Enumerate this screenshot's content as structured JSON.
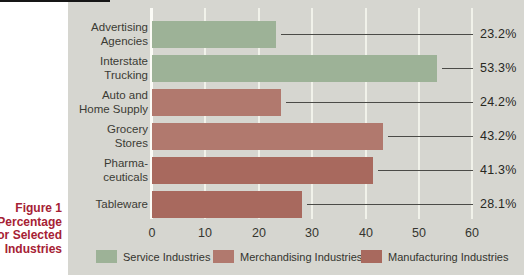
{
  "figure_label": {
    "lines": [
      "Figure 1",
      "Percentage",
      "for Selected",
      "Industries"
    ]
  },
  "colors": {
    "page_bg": "#ffffff",
    "panel_bg": "#d6d6d0",
    "gridline": "#f1f2ea",
    "axis_line": "#fbfbf6",
    "callout_line": "#4b4b47",
    "figure_label_text": "#a62134",
    "page_edge_line": "#161616",
    "series": {
      "service": "#9db297",
      "merchandising": "#b1796e",
      "manufacturing": "#a8695e"
    }
  },
  "chart_data": {
    "type": "bar",
    "orientation": "horizontal",
    "title": "",
    "xlabel": "",
    "ylabel": "",
    "xlim": [
      0,
      60
    ],
    "x_ticks": [
      0,
      10,
      20,
      30,
      40,
      50,
      60
    ],
    "grid": true,
    "legend_position": "bottom",
    "categories": [
      "Advertising Agencies",
      "Interstate Trucking",
      "Auto and Home Supply",
      "Grocery Stores",
      "Pharmaceuticals",
      "Tableware"
    ],
    "category_label_lines": [
      [
        "Advertising",
        "Agencies"
      ],
      [
        "Interstate",
        "Trucking"
      ],
      [
        "Auto and",
        "Home Supply"
      ],
      [
        "Grocery",
        "Stores"
      ],
      [
        "Pharma-",
        "ceuticals"
      ],
      [
        "Tableware"
      ]
    ],
    "values": [
      23.2,
      53.3,
      24.2,
      43.2,
      41.3,
      28.1
    ],
    "value_labels": [
      "23.2%",
      "53.3%",
      "24.2%",
      "43.2%",
      "41.3%",
      "28.1%"
    ],
    "bar_series": [
      "service",
      "service",
      "merchandising",
      "merchandising",
      "manufacturing",
      "manufacturing"
    ],
    "legend": [
      {
        "label": "Service Industries",
        "key": "service"
      },
      {
        "label": "Merchandising Industries",
        "key": "merchandising"
      },
      {
        "label": "Manufacturing Industries",
        "key": "manufacturing"
      }
    ]
  }
}
